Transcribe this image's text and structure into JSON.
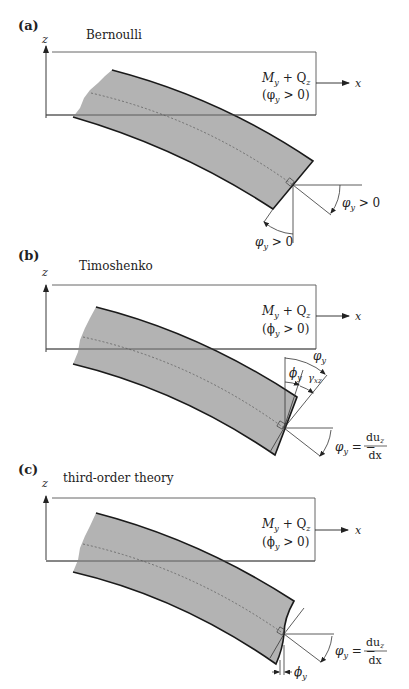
{
  "figure": {
    "panels": [
      {
        "id": "a",
        "label": "(a)",
        "title": "Bernoulli",
        "axis_z": "z",
        "axis_x": "x",
        "load_label": "M_y + Q_z",
        "load_line1_main": "M",
        "load_line1_sub1": "y",
        "load_line1_mid": " + Q",
        "load_line1_sub2": "z",
        "condition": "(φ_y > 0)",
        "condition_open": "(φ",
        "condition_sub": "y",
        "condition_close": " > 0)",
        "angle_labels": [
          {
            "main": "φ",
            "sub": "y",
            "rest": " > 0",
            "position": "right"
          },
          {
            "main": "φ",
            "sub": "y",
            "rest": " > 0",
            "position": "bottom"
          }
        ]
      },
      {
        "id": "b",
        "label": "(b)",
        "title": "Timoshenko",
        "axis_z": "z",
        "axis_x": "x",
        "load_label": "M_y + Q_z",
        "load_line1_main": "M",
        "load_line1_sub1": "y",
        "load_line1_mid": " + Q",
        "load_line1_sub2": "z",
        "condition": "(ϕ_y > 0)",
        "condition_open": "(ϕ",
        "condition_sub": "y",
        "condition_close": " > 0)",
        "angle_labels": [
          {
            "main": "φ",
            "sub": "y",
            "position": "top"
          },
          {
            "main": "ϕ",
            "sub": "y",
            "position": "inner"
          },
          {
            "main": "γ",
            "sub": "xz",
            "position": "shear"
          },
          {
            "main": "φ",
            "sub": "y",
            "rest": " = −",
            "frac_num": "du",
            "frac_num_sub": "z",
            "frac_den": "dx",
            "position": "right"
          }
        ]
      },
      {
        "id": "c",
        "label": "(c)",
        "title": "third-order theory",
        "axis_z": "z",
        "axis_x": "x",
        "load_label": "M_y + Q_z",
        "load_line1_main": "M",
        "load_line1_sub1": "y",
        "load_line1_mid": " + Q",
        "load_line1_sub2": "z",
        "condition": "(ϕ_y > 0)",
        "condition_open": "(ϕ",
        "condition_sub": "y",
        "condition_close": " > 0)",
        "angle_labels": [
          {
            "main": "φ",
            "sub": "y",
            "rest": " = −",
            "frac_num": "du",
            "frac_num_sub": "z",
            "frac_den": "dx",
            "position": "right"
          },
          {
            "main": "ϕ",
            "sub": "y",
            "position": "bottom"
          }
        ]
      }
    ],
    "colors": {
      "beam_fill": "#b3b3b3",
      "beam_edge": "#1a1a1a",
      "lines": "#333333",
      "background": "#ffffff"
    }
  }
}
